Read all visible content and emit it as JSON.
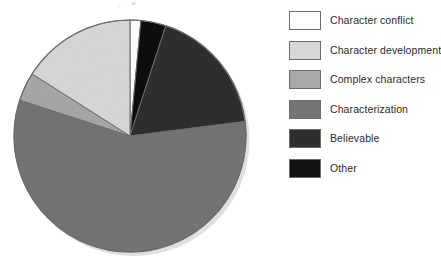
{
  "chart_data": {
    "type": "pie",
    "title": "",
    "subtitle": "",
    "xlabel": "",
    "ylabel": "",
    "grid": false,
    "legend_position": "right",
    "categories": [
      "Character conflict",
      "Character development",
      "Complex characters",
      "Characterization",
      "Believable",
      "Other"
    ],
    "values": [
      1.5,
      16,
      4,
      18,
      57,
      3.5
    ],
    "units": "percent",
    "slice_colors": [
      "#ffffff",
      "#d8d8d8",
      "#a8a8a8",
      "#757575",
      "#2e2e2e",
      "#111111"
    ],
    "start_angle_deg": 0,
    "direction": "clockwise",
    "slices": [
      {
        "label": "Character conflict",
        "value": 1.5,
        "color": "#ffffff",
        "start_deg": 0,
        "end_deg": 5.4
      },
      {
        "label": "Other",
        "value": 3.5,
        "color": "#111111",
        "start_deg": 5.4,
        "end_deg": 18.0
      },
      {
        "label": "Characterization",
        "value": 18,
        "color": "#2e2e2e",
        "start_deg": 18.0,
        "end_deg": 82.8
      },
      {
        "label": "Believable",
        "value": 57,
        "color": "#757575",
        "start_deg": 82.8,
        "end_deg": 288.0
      },
      {
        "label": "Complex characters",
        "value": 4,
        "color": "#a8a8a8",
        "start_deg": 288.0,
        "end_deg": 302.4
      },
      {
        "label": "Character development",
        "value": 16,
        "color": "#d8d8d8",
        "start_deg": 302.4,
        "end_deg": 360.0
      }
    ]
  },
  "legend": {
    "items": [
      {
        "label": "Character conflict",
        "swatch_name": "legend-swatch-character-conflict",
        "color": "#ffffff"
      },
      {
        "label": "Character development",
        "swatch_name": "legend-swatch-character-development",
        "color": "#d8d8d8"
      },
      {
        "label": "Complex characters",
        "swatch_name": "legend-swatch-complex-characters",
        "color": "#a8a8a8"
      },
      {
        "label": "Characterization",
        "swatch_name": "legend-swatch-characterization",
        "color": "#757575"
      },
      {
        "label": "Believable",
        "swatch_name": "legend-swatch-believable",
        "color": "#2e2e2e"
      },
      {
        "label": "Other",
        "swatch_name": "legend-swatch-other",
        "color": "#111111"
      }
    ]
  },
  "colors": {
    "background": "#ffffff",
    "outline": "#6d6d6d",
    "text": "#2b2b2b",
    "shadow": "#c4c4c4"
  }
}
